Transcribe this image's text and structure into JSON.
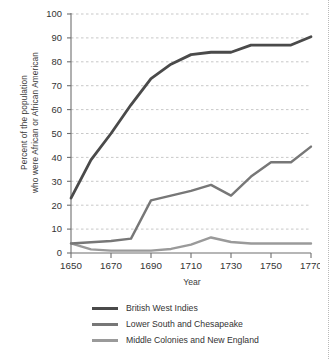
{
  "chart_data": {
    "type": "line",
    "title": "",
    "xlabel": "Year",
    "ylabel": "Percent of the population who were African or African American",
    "ylabel_line1": "Percent of the population",
    "ylabel_line2": "who were African or African American",
    "xlim": [
      1650,
      1770
    ],
    "ylim": [
      0,
      100
    ],
    "xticks": [
      1650,
      1670,
      1690,
      1710,
      1730,
      1750,
      1770
    ],
    "yticks": [
      0,
      10,
      20,
      30,
      40,
      50,
      60,
      70,
      80,
      90,
      100
    ],
    "grid": "horizontal dashed",
    "legend_position": "below-plot",
    "series": [
      {
        "name": "British West Indies",
        "color": "#4a4a4a",
        "x": [
          1650,
          1660,
          1670,
          1680,
          1690,
          1700,
          1710,
          1720,
          1730,
          1740,
          1750,
          1760,
          1770
        ],
        "values": [
          23,
          39,
          50,
          62,
          73,
          79,
          83,
          84,
          84,
          87,
          87,
          87,
          90.5
        ]
      },
      {
        "name": "Lower South and Chesapeake",
        "color": "#777777",
        "x": [
          1650,
          1660,
          1670,
          1680,
          1690,
          1700,
          1710,
          1720,
          1730,
          1740,
          1750,
          1760,
          1770
        ],
        "values": [
          4,
          4.5,
          5,
          6,
          22,
          24,
          26,
          28.5,
          24,
          32,
          38,
          38,
          44.5
        ]
      },
      {
        "name": "Middle Colonies and New England",
        "color": "#9a9a9a",
        "x": [
          1650,
          1660,
          1670,
          1680,
          1690,
          1700,
          1710,
          1720,
          1730,
          1740,
          1750,
          1760,
          1770
        ],
        "values": [
          4,
          1.5,
          1,
          1,
          1,
          1.7,
          3.5,
          6.5,
          4.6,
          4,
          4,
          4,
          4
        ]
      }
    ]
  },
  "axes": {
    "x_title": "Year",
    "y_title_line1": "Percent of the population",
    "y_title_line2": "who were African or African American",
    "x_tick_labels": [
      "1650",
      "1670",
      "1690",
      "1710",
      "1730",
      "1750",
      "1770"
    ],
    "y_tick_labels": [
      "100",
      "90",
      "80",
      "70",
      "60",
      "50",
      "40",
      "30",
      "20",
      "10",
      "0"
    ]
  },
  "legend": {
    "items": [
      {
        "label": "British West Indies",
        "color": "#4a4a4a"
      },
      {
        "label": "Lower South and Chesapeake",
        "color": "#777777"
      },
      {
        "label": "Middle Colonies and New England",
        "color": "#9a9a9a"
      }
    ]
  },
  "footer": {
    "sliver_text": ""
  }
}
